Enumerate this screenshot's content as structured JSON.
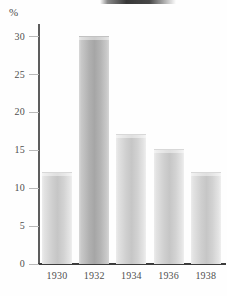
{
  "chart_data": {
    "type": "bar",
    "title": "",
    "xlabel": "",
    "ylabel": "%",
    "categories": [
      "1930",
      "1932",
      "1934",
      "1936",
      "1938"
    ],
    "values": [
      12,
      30,
      17,
      15,
      12
    ],
    "ylim": [
      0,
      30
    ],
    "ytick_labels": [
      "0",
      "5",
      "10",
      "15",
      "20",
      "25",
      "30"
    ],
    "ytick_values": [
      0,
      5,
      10,
      15,
      20,
      25,
      30
    ],
    "grid": false,
    "legend": null,
    "series": [
      {
        "name": "",
        "values": [
          12,
          30,
          17,
          15,
          12
        ]
      }
    ],
    "annotations": [],
    "colors": {
      "bar_light": "#cfcfcf",
      "bar_highlight": "#ececec",
      "bar_dark": "#b0b0b0",
      "axis": "#3c3c3c",
      "tick": "#b9b9b9",
      "text": "#4f4f4f",
      "background": "#fefefe"
    },
    "emphasis_index": 1
  },
  "axis": {
    "unit_label": "%"
  }
}
